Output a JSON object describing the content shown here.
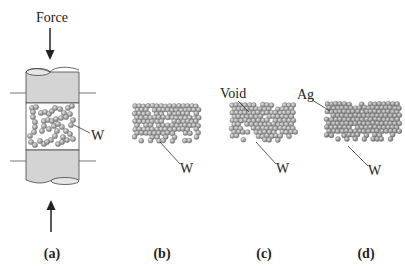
{
  "diagram": {
    "force_label": "Force",
    "panels": [
      {
        "id": "a",
        "caption": "(a)",
        "labels": [
          "W"
        ]
      },
      {
        "id": "b",
        "caption": "(b)",
        "labels": [
          "W"
        ]
      },
      {
        "id": "c",
        "caption": "(c)",
        "labels": [
          "Void",
          "W"
        ]
      },
      {
        "id": "d",
        "caption": "(d)",
        "labels": [
          "Ag",
          "W"
        ]
      }
    ],
    "colors": {
      "cylinder": "#d4d4d4",
      "particle": "#a8a8a8",
      "particle_dark": "#8a8a8a",
      "line": "#333333"
    }
  }
}
